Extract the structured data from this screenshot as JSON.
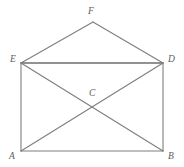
{
  "figure": {
    "background_color": "#ffffff",
    "line_color": "#7e7e7e",
    "label_color": "#5c5c5c",
    "width": 184,
    "height": 167,
    "vertices": [
      {
        "id": "A",
        "label": "A",
        "x": 21,
        "y": 151,
        "label_x": 9,
        "label_y": 152
      },
      {
        "id": "B",
        "label": "B",
        "x": 163,
        "y": 151,
        "label_x": 168,
        "label_y": 152
      },
      {
        "id": "C",
        "label": "C",
        "x": 93,
        "y": 104,
        "label_x": 89,
        "label_y": 89
      },
      {
        "id": "D",
        "label": "D",
        "x": 163,
        "y": 63,
        "label_x": 168,
        "label_y": 55
      },
      {
        "id": "E",
        "label": "E",
        "x": 21,
        "y": 63,
        "label_x": 10,
        "label_y": 55
      },
      {
        "id": "F",
        "label": "F",
        "x": 93,
        "y": 22,
        "label_x": 88,
        "label_y": 7
      }
    ],
    "edges": [
      {
        "id": "EF",
        "from": "E",
        "to": "F",
        "x1": 21,
        "y1": 63,
        "x2": 93,
        "y2": 22
      },
      {
        "id": "FD",
        "from": "F",
        "to": "D",
        "x1": 93,
        "y1": 22,
        "x2": 163,
        "y2": 63
      },
      {
        "id": "ED",
        "from": "E",
        "to": "D",
        "x1": 21,
        "y1": 63,
        "x2": 163,
        "y2": 63
      },
      {
        "id": "EA",
        "from": "E",
        "to": "A",
        "x1": 21,
        "y1": 63,
        "x2": 21,
        "y2": 151
      },
      {
        "id": "DB",
        "from": "D",
        "to": "B",
        "x1": 163,
        "y1": 63,
        "x2": 163,
        "y2": 151
      },
      {
        "id": "AB",
        "from": "A",
        "to": "B",
        "x1": 21,
        "y1": 151,
        "x2": 163,
        "y2": 151
      },
      {
        "id": "AD",
        "from": "A",
        "to": "D",
        "x1": 21,
        "y1": 151,
        "x2": 163,
        "y2": 63
      },
      {
        "id": "EB",
        "from": "E",
        "to": "B",
        "x1": 21,
        "y1": 63,
        "x2": 163,
        "y2": 151
      }
    ]
  }
}
